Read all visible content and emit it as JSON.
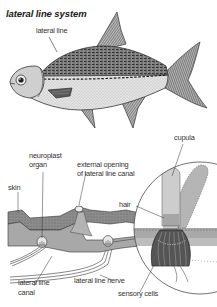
{
  "title": "lateral line system",
  "fish_labels": {
    "lateral_line": "lateral line"
  },
  "section_labels": {
    "cupula": "cupula",
    "neuroplast_organ_1": "neuroplast",
    "neuroplast_organ_2": "organ",
    "external_opening_1": "external opening",
    "external_opening_2": "of lateral line canal",
    "skin": "skin",
    "hair": "hair",
    "lateral_line_canal_1": "lateral line",
    "lateral_line_canal_2": "canal",
    "lateral_line_nerve": "lateral line nerve",
    "sensory_cells": "sensory cells"
  },
  "colors": {
    "ink": "#2a2a2a",
    "body_light": "#d8d8d8",
    "body_dark": "#6e6e6e",
    "tissue": "#9a9a9a",
    "cupula": "#c4c4c4",
    "background": "#ffffff"
  }
}
